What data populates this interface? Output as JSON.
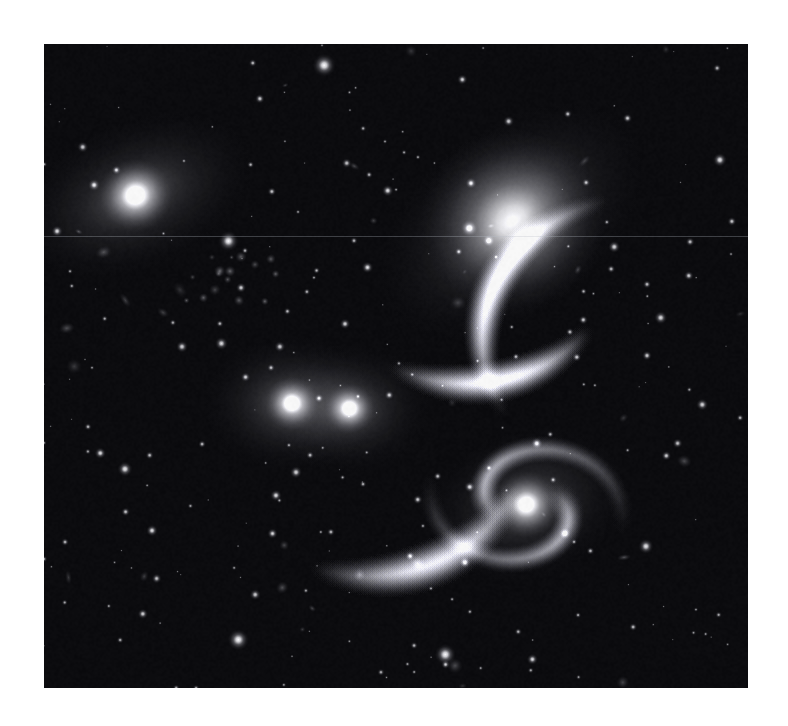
{
  "page": {
    "background_color": "#ffffff",
    "width": 788,
    "height": 726,
    "caption": ""
  },
  "image": {
    "kind": "astronomical-photograph",
    "subject": "Stephan's Quintet compact galaxy group",
    "color_mode": "grayscale",
    "frame": {
      "x": 44,
      "y": 44,
      "width": 704,
      "height": 644
    },
    "sky_color": "#07070a",
    "star_color": "#ffffff",
    "galaxy_glow_color": "#d8d8d8",
    "plate_seam_y": 236,
    "notes": "no visible text, labels, scale bars or compass in the frame"
  },
  "galaxies": [
    {
      "name": "upper-left-elliptical",
      "cx": 0.13,
      "cy": 0.235,
      "rx": 0.175,
      "ry": 0.115,
      "angle": -22,
      "core_radius": 0.022,
      "peak": 1.0,
      "halo": 0.55
    },
    {
      "name": "upper-right-diffuse-spiral",
      "cx": 0.665,
      "cy": 0.275,
      "rx": 0.215,
      "ry": 0.145,
      "angle": -38,
      "core_radius": 0.055,
      "peak": 0.6,
      "halo": 0.62
    },
    {
      "name": "central-pair-north",
      "cx": 0.352,
      "cy": 0.558,
      "rx": 0.125,
      "ry": 0.105,
      "angle": 0,
      "core_radius": 0.016,
      "peak": 1.0,
      "halo": 0.58
    },
    {
      "name": "central-pair-south",
      "cx": 0.434,
      "cy": 0.566,
      "rx": 0.115,
      "ry": 0.1,
      "angle": 0,
      "core_radius": 0.015,
      "peak": 1.0,
      "halo": 0.54
    },
    {
      "name": "lower-right-barred-spiral",
      "cx": 0.685,
      "cy": 0.715,
      "rx": 0.145,
      "ry": 0.115,
      "angle": -18,
      "core_radius": 0.02,
      "peak": 0.92,
      "halo": 0.52
    }
  ],
  "tidal_arcs": [
    {
      "name": "upper-right-tail",
      "cx": 0.86,
      "cy": 0.46,
      "r": 0.26,
      "a0": 150,
      "a1": 255,
      "w": 0.028,
      "b": 0.34
    },
    {
      "name": "north-bridge",
      "cx": 0.6,
      "cy": 0.33,
      "r": 0.23,
      "a0": 35,
      "a1": 120,
      "w": 0.03,
      "b": 0.26
    },
    {
      "name": "south-plume",
      "cx": 0.46,
      "cy": 0.62,
      "r": 0.24,
      "a0": 20,
      "a1": 110,
      "w": 0.034,
      "b": 0.22
    }
  ],
  "star_counts": {
    "bright_stars": 26,
    "field_stars": 230,
    "faint_knots": 34
  },
  "bright_stars": [
    {
      "x": 0.398,
      "y": 0.033,
      "r": 11.5,
      "i": 1.0
    },
    {
      "x": 0.262,
      "y": 0.306,
      "r": 10.0,
      "i": 1.0
    },
    {
      "x": 0.129,
      "y": 0.235,
      "r": 8.0,
      "i": 0.95
    },
    {
      "x": 0.604,
      "y": 0.286,
      "r": 8.5,
      "i": 0.98
    },
    {
      "x": 0.96,
      "y": 0.18,
      "r": 7.0,
      "i": 0.92
    },
    {
      "x": 0.876,
      "y": 0.425,
      "r": 6.5,
      "i": 0.88
    },
    {
      "x": 0.81,
      "y": 0.315,
      "r": 6.0,
      "i": 0.86
    },
    {
      "x": 0.276,
      "y": 0.925,
      "r": 10.5,
      "i": 1.0
    },
    {
      "x": 0.57,
      "y": 0.948,
      "r": 10.5,
      "i": 1.0
    },
    {
      "x": 0.855,
      "y": 0.78,
      "r": 7.5,
      "i": 0.92
    },
    {
      "x": 0.115,
      "y": 0.66,
      "r": 7.5,
      "i": 0.92
    },
    {
      "x": 0.358,
      "y": 0.665,
      "r": 6.0,
      "i": 0.86
    },
    {
      "x": 0.252,
      "y": 0.465,
      "r": 6.5,
      "i": 0.88
    },
    {
      "x": 0.196,
      "y": 0.47,
      "r": 6.0,
      "i": 0.84
    },
    {
      "x": 0.335,
      "y": 0.47,
      "r": 5.5,
      "i": 0.82
    },
    {
      "x": 0.598,
      "y": 0.805,
      "r": 6.0,
      "i": 0.86
    },
    {
      "x": 0.7,
      "y": 0.62,
      "r": 6.0,
      "i": 0.86
    },
    {
      "x": 0.74,
      "y": 0.76,
      "r": 6.0,
      "i": 0.86
    },
    {
      "x": 0.935,
      "y": 0.56,
      "r": 6.0,
      "i": 0.86
    },
    {
      "x": 0.9,
      "y": 0.62,
      "r": 5.0,
      "i": 0.8
    },
    {
      "x": 0.055,
      "y": 0.16,
      "r": 5.5,
      "i": 0.82
    },
    {
      "x": 0.43,
      "y": 0.185,
      "r": 5.0,
      "i": 0.8
    },
    {
      "x": 0.52,
      "y": 0.795,
      "r": 5.0,
      "i": 0.8
    },
    {
      "x": 0.3,
      "y": 0.855,
      "r": 5.5,
      "i": 0.82
    },
    {
      "x": 0.66,
      "y": 0.12,
      "r": 5.5,
      "i": 0.82
    },
    {
      "x": 0.16,
      "y": 0.83,
      "r": 5.0,
      "i": 0.78
    }
  ]
}
